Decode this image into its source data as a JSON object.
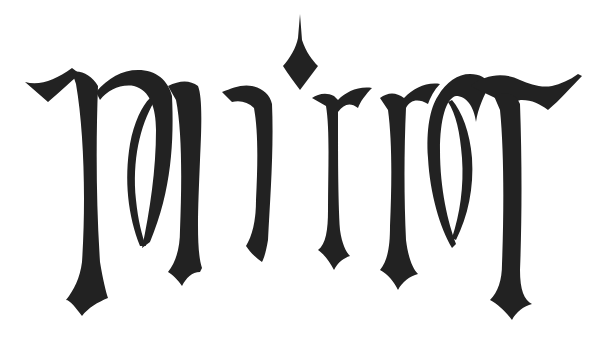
{
  "artwork": {
    "type": "calligraphic ambigram",
    "word": "mirror",
    "ink_color": "#222222",
    "background_color": "#ffffff",
    "letters": [
      "m",
      "i",
      "r",
      "r",
      "o",
      "r"
    ]
  }
}
